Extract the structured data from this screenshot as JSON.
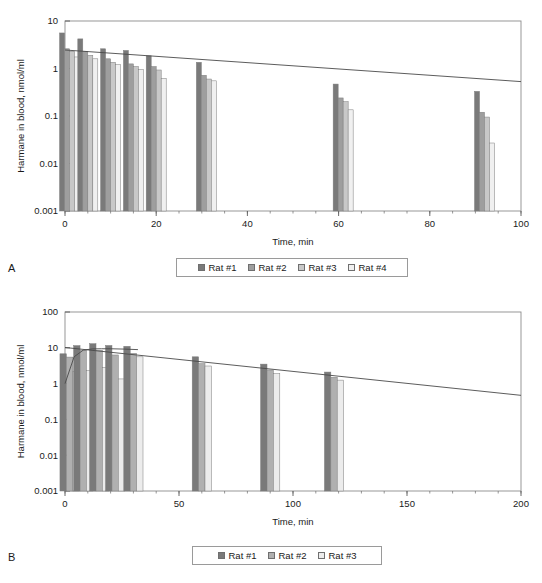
{
  "figure": {
    "panels": [
      {
        "letter": "A",
        "legend": {
          "items": [
            {
              "label": "Rat #1",
              "color": "#7a7a7a"
            },
            {
              "label": "Rat #2",
              "color": "#9e9e9e"
            },
            {
              "label": "Rat #3",
              "color": "#c8c8c8"
            },
            {
              "label": "Rat #4",
              "color": "#f0f0f0"
            }
          ]
        },
        "chart_data": {
          "type": "bar",
          "title": "",
          "xlabel": "Time, min",
          "ylabel": "Harmane in blood, nmol/ml",
          "yscale": "log",
          "ylim": [
            0.001,
            10
          ],
          "yticks": [
            0.001,
            0.01,
            0.1,
            1,
            10
          ],
          "ytick_labels": [
            "0.001",
            "0.01",
            "0.1",
            "1",
            "10"
          ],
          "xlim": [
            0,
            100
          ],
          "xticks": [
            0,
            20,
            40,
            60,
            80,
            100
          ],
          "xtick_labels": [
            "0",
            "20",
            "40",
            "60",
            "80",
            "100"
          ],
          "xminor_step": 5,
          "grid": false,
          "legend_position": "below",
          "categories": [
            1,
            5,
            10,
            15,
            20,
            31,
            61,
            92
          ],
          "series": [
            {
              "name": "Rat #1",
              "color": "#7a7a7a",
              "values": [
                5.6,
                4.2,
                2.6,
                2.4,
                1.85,
                1.35,
                0.47,
                0.33
              ]
            },
            {
              "name": "Rat #2",
              "color": "#9e9e9e",
              "values": [
                2.6,
                2.3,
                1.6,
                1.25,
                1.1,
                0.72,
                0.24,
                0.12
              ]
            },
            {
              "name": "Rat #3",
              "color": "#c8c8c8",
              "values": [
                2.3,
                1.9,
                1.35,
                1.1,
                0.93,
                0.6,
                0.2,
                0.095
              ]
            },
            {
              "name": "Rat #4",
              "color": "#f0f0f0",
              "values": [
                1.75,
                1.6,
                1.2,
                0.95,
                0.62,
                0.55,
                0.135,
                0.027
              ]
            }
          ],
          "trendline": {
            "type": "linear-on-log",
            "x": [
              0,
              100
            ],
            "y": [
              2.45,
              0.53
            ]
          }
        }
      },
      {
        "letter": "B",
        "legend": {
          "items": [
            {
              "label": "Rat #1",
              "color": "#7a7a7a"
            },
            {
              "label": "Rat #2",
              "color": "#b0b0b0"
            },
            {
              "label": "Rat #3",
              "color": "#ececec"
            }
          ]
        },
        "chart_data": {
          "type": "bar",
          "title": "",
          "xlabel": "Time, min",
          "ylabel": "Harmane in blood, nmol/ml",
          "yscale": "log",
          "ylim": [
            0.001,
            100
          ],
          "yticks": [
            0.001,
            0.01,
            0.1,
            1,
            10,
            100
          ],
          "ytick_labels": [
            "0.001",
            "0.01",
            "0.1",
            "1",
            "10",
            "100"
          ],
          "xlim": [
            0,
            200
          ],
          "xticks": [
            0,
            50,
            100,
            150,
            200
          ],
          "xtick_labels": [
            "0",
            "50",
            "100",
            "150",
            "200"
          ],
          "xminor_step": 10,
          "grid": false,
          "legend_position": "below",
          "categories": [
            2,
            8,
            15,
            22,
            30,
            60,
            90,
            118
          ],
          "series": [
            {
              "name": "Rat #1",
              "color": "#7a7a7a",
              "values": [
                6.8,
                11.5,
                13.0,
                11.6,
                11.0,
                5.6,
                3.5,
                2.1
              ]
            },
            {
              "name": "Rat #2",
              "color": "#b0b0b0",
              "values": [
                5.5,
                8.4,
                8.4,
                6.3,
                7.0,
                3.6,
                2.4,
                1.5
              ]
            },
            {
              "name": "Rat #3",
              "color": "#ececec",
              "values": [
                2.2,
                2.3,
                2.8,
                1.35,
                5.6,
                3.1,
                1.9,
                1.25
              ]
            }
          ],
          "trendline": {
            "type": "linear-on-log",
            "x": [
              0,
              200
            ],
            "y": [
              10.2,
              0.47
            ]
          },
          "fitcurve": {
            "type": "absorption-elimination",
            "x": [
              0,
              4,
              8,
              12,
              16,
              20,
              26,
              32
            ],
            "y": [
              1.0,
              5.6,
              8.6,
              9.3,
              9.4,
              9.4,
              9.2,
              8.9
            ]
          }
        }
      }
    ]
  }
}
